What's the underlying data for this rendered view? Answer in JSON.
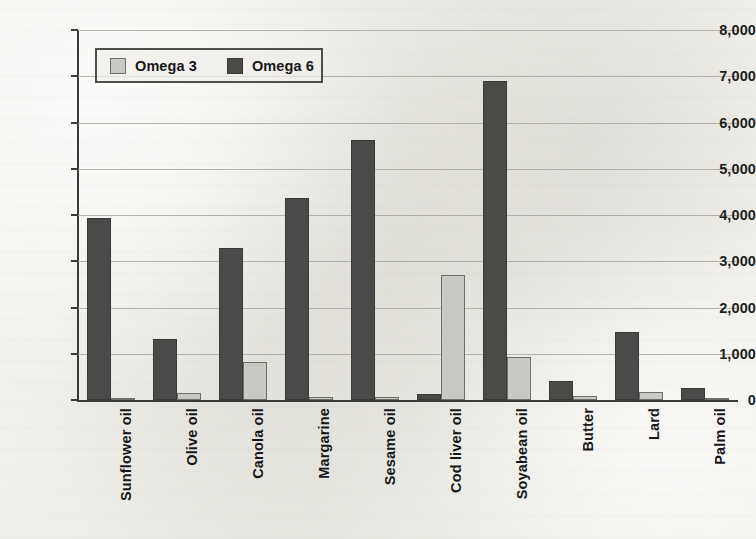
{
  "chart_data": {
    "type": "bar",
    "title": "",
    "xlabel": "",
    "ylabel": "",
    "ylim": [
      0,
      8000
    ],
    "ytick_labels": [
      "0",
      "1,000",
      "2,000",
      "3,000",
      "4,000",
      "5,000",
      "6,000",
      "7,000",
      "8,000"
    ],
    "ytick_values": [
      0,
      1000,
      2000,
      3000,
      4000,
      5000,
      6000,
      7000,
      8000
    ],
    "grid": true,
    "legend_position": "top-left-inside",
    "categories": [
      "Sunflower oil",
      "Olive oil",
      "Canola oil",
      "Margarine",
      "Sesame oil",
      "Cod liver oil",
      "Soyabean oil",
      "Butter",
      "Lard",
      "Palm oil"
    ],
    "series": [
      {
        "name": "Omega 3",
        "color": "#c9c9c4",
        "values": [
          20,
          160,
          830,
          60,
          60,
          2700,
          930,
          80,
          170,
          20
        ]
      },
      {
        "name": "Omega 6",
        "color": "#4a4a48",
        "values": [
          3940,
          1320,
          3280,
          4375,
          5620,
          130,
          6900,
          420,
          1480,
          270
        ]
      }
    ]
  },
  "legend": {
    "items": [
      {
        "label": "Omega 3",
        "swatch": "omega3"
      },
      {
        "label": "Omega 6",
        "swatch": "omega6"
      }
    ]
  }
}
